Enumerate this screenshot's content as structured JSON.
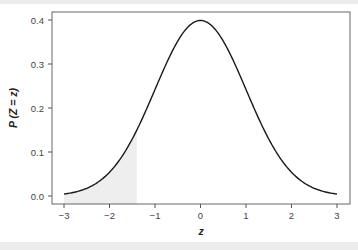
{
  "chart_data": {
    "type": "line",
    "title": "",
    "xlabel": "z",
    "ylabel": "P (Z = z)",
    "xlim": [
      -3,
      3
    ],
    "ylim": [
      0,
      0.4
    ],
    "x_ticks": [
      -3,
      -2,
      -1,
      0,
      1,
      2,
      3
    ],
    "x_tick_labels": [
      "−3",
      "−2",
      "−1",
      "0",
      "1",
      "2",
      "3"
    ],
    "y_ticks": [
      0.0,
      0.1,
      0.2,
      0.3,
      0.4
    ],
    "y_tick_labels": [
      "0.0",
      "0.1",
      "0.2",
      "0.3",
      "0.4"
    ],
    "grid": false,
    "legend": null,
    "series": [
      {
        "name": "Standard normal density",
        "x": [
          -3,
          -2.5,
          -2,
          -1.5,
          -1,
          -0.5,
          0,
          0.5,
          1,
          1.5,
          2,
          2.5,
          3
        ],
        "values": [
          0.0044,
          0.0175,
          0.054,
          0.1295,
          0.242,
          0.3521,
          0.3989,
          0.3521,
          0.242,
          0.1295,
          0.054,
          0.0175,
          0.0044
        ]
      }
    ],
    "shaded_region": {
      "from": -3,
      "to": -1.4,
      "color": "#eeeeee",
      "description": "area under curve left of z ≈ -1.4"
    },
    "colors": {
      "curve": "#1a1a1a",
      "axis": "#555555",
      "shade": "#eeeeee"
    }
  }
}
